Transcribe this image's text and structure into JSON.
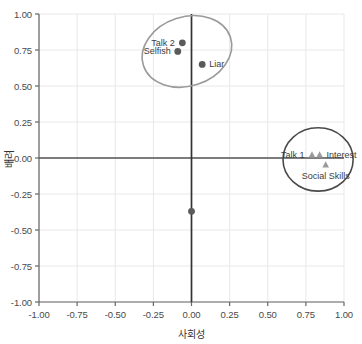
{
  "chart_data": {
    "type": "scatter",
    "title": "",
    "xlabel": "사회성",
    "ylabel": "배려",
    "xlim": [
      -1.0,
      1.0
    ],
    "ylim": [
      -1.0,
      1.0
    ],
    "grid": true,
    "legend": "none",
    "x_ticks": [
      "-1.00",
      "-0.75",
      "-0.50",
      "-0.25",
      "0.00",
      "0.25",
      "0.50",
      "0.75",
      "1.00"
    ],
    "x_tick_values": [
      -1.0,
      -0.75,
      -0.5,
      -0.25,
      0.0,
      0.25,
      0.5,
      0.75,
      1.0
    ],
    "y_ticks": [
      "1.00",
      "0.75",
      "0.50",
      "0.25",
      "0.00",
      "-0.25",
      "-0.50",
      "-0.75",
      "-1.00"
    ],
    "y_tick_values": [
      1.0,
      0.75,
      0.5,
      0.25,
      0.0,
      -0.25,
      -0.5,
      -0.75,
      -1.0
    ],
    "series": [
      {
        "name": "circle-group",
        "marker": "circle",
        "color": "#5a5a5a",
        "points": [
          {
            "label": "Talk 2",
            "x": -0.06,
            "y": 0.8,
            "label_pos": "left"
          },
          {
            "label": "Selfish",
            "x": -0.09,
            "y": 0.74,
            "label_pos": "left"
          },
          {
            "label": "Liar",
            "x": 0.07,
            "y": 0.65,
            "label_pos": "right"
          },
          {
            "label": "",
            "x": 0.0,
            "y": -0.37,
            "label_pos": "none"
          }
        ]
      },
      {
        "name": "triangle-group",
        "marker": "triangle",
        "color": "#9a9a9a",
        "points": [
          {
            "label": "Talk 1",
            "x": 0.79,
            "y": 0.02,
            "label_pos": "left"
          },
          {
            "label": "Interest",
            "x": 0.84,
            "y": 0.02,
            "label_pos": "right"
          },
          {
            "label": "Social Skills",
            "x": 0.88,
            "y": -0.05,
            "label_pos": "below"
          }
        ]
      }
    ],
    "ellipses": [
      {
        "name": "upper-cluster-ellipse",
        "cx": -0.03,
        "cy": 0.74,
        "rx": 0.3,
        "ry": 0.24,
        "rotation": -18,
        "color": "#9a9a9a"
      },
      {
        "name": "right-cluster-ellipse",
        "cx": 0.83,
        "cy": -0.01,
        "rx": 0.23,
        "ry": 0.22,
        "rotation": 0,
        "color": "#4a4a4a"
      }
    ],
    "colors": {
      "grid": "#e8e8e8",
      "axis_line": "#555555",
      "frame": "#666666",
      "circle_marker": "#5a5a5a",
      "triangle_marker": "#9a9a9a",
      "text": "#3c3c3c",
      "background": "#ffffff"
    }
  }
}
